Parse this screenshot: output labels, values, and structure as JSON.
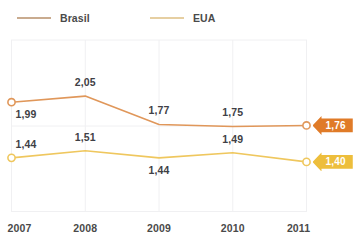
{
  "legend": {
    "items": [
      {
        "label": "Brasil",
        "color": "#c9ab8f",
        "series_color": "#e0975a"
      },
      {
        "label": "EUA",
        "color": "#e6cfa2",
        "series_color": "#efc75e"
      }
    ]
  },
  "axis": {
    "x_ticks": [
      "2007",
      "2008",
      "2009",
      "2010",
      "2011"
    ]
  },
  "badges": {
    "brasil": {
      "text": "1,76",
      "color": "#e07b28"
    },
    "eua": {
      "text": "1,40",
      "color": "#edbe3c"
    }
  },
  "value_labels": {
    "brasil": [
      "1,99",
      "2,05",
      "1,77",
      "1,75",
      "1,76"
    ],
    "eua": [
      "1,44",
      "1,51",
      "1,44",
      "1,49",
      "1,40"
    ]
  },
  "chart_data": {
    "type": "line",
    "title": "",
    "subtitle": "",
    "xlabel": "",
    "ylabel": "",
    "categories": [
      "2007",
      "2008",
      "2009",
      "2010",
      "2011"
    ],
    "series": [
      {
        "name": "Brasil",
        "color": "#e0975a",
        "values": [
          1.99,
          2.05,
          1.77,
          1.75,
          1.76
        ],
        "labels": [
          "1,99",
          "2,05",
          "1,77",
          "1,75",
          "1,76"
        ],
        "label_positions": [
          "below",
          "above",
          "above",
          "above",
          "badge"
        ],
        "markers": [
          true,
          false,
          false,
          false,
          true
        ]
      },
      {
        "name": "EUA",
        "color": "#efc75e",
        "values": [
          1.44,
          1.51,
          1.44,
          1.49,
          1.4
        ],
        "labels": [
          "1,44",
          "1,51",
          "1,44",
          "1,49",
          "1,40"
        ],
        "label_positions": [
          "above",
          "above",
          "below",
          "above",
          "badge"
        ],
        "markers": [
          true,
          false,
          false,
          false,
          true
        ]
      }
    ],
    "ylim": [
      1.3,
      2.15
    ],
    "grid": {
      "vertical": true,
      "horizontal": true,
      "color": "#f0f0f2"
    },
    "legend_position": "top-left"
  }
}
